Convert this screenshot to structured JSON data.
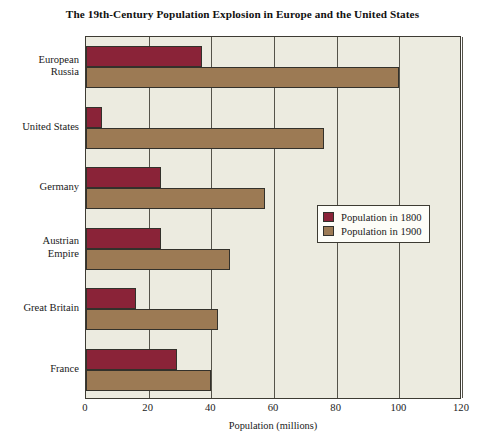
{
  "chart_data": {
    "type": "bar",
    "orientation": "horizontal",
    "title": "The 19th-Century Population Explosion in Europe and the United States",
    "xlabel": "Population (millions)",
    "ylabel": "",
    "xlim": [
      0,
      120
    ],
    "xticks": [
      0,
      20,
      40,
      60,
      80,
      100,
      120
    ],
    "xtick_labels": [
      "0",
      "20",
      "40",
      "60",
      "80",
      "100",
      "120"
    ],
    "grid": true,
    "grid_axis": "x",
    "legend_position": "center-right",
    "categories": [
      "European\nRussia",
      "United States",
      "Germany",
      "Austrian\nEmpire",
      "Great Britain",
      "France"
    ],
    "category_labels": [
      [
        "European",
        "Russia"
      ],
      [
        "United States"
      ],
      [
        "Germany"
      ],
      [
        "Austrian",
        "Empire"
      ],
      [
        "Great Britain"
      ],
      [
        "France"
      ]
    ],
    "series": [
      {
        "name": "Population in 1800",
        "color": "#8a2338",
        "values": [
          37,
          5,
          24,
          24,
          16,
          29
        ]
      },
      {
        "name": "Population in 1900",
        "color": "#9c7a54",
        "values": [
          100,
          76,
          57,
          46,
          42,
          40
        ]
      }
    ]
  },
  "legend": {
    "entries": [
      {
        "label": "Population in 1800",
        "color": "#8a2338"
      },
      {
        "label": "Population in 1900",
        "color": "#9c7a54"
      }
    ]
  },
  "colors": {
    "page_background": "#ffffff",
    "plot_background": "#ecebe0",
    "axis": "#3d3b33",
    "gridline": "#55534a",
    "legend_background": "#fdfdf8",
    "series_1800": "#8a2338",
    "series_1900": "#9c7a54",
    "text": "#1a1a1a"
  }
}
